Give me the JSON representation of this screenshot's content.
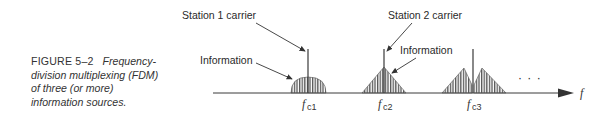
{
  "caption": {
    "figure_label": "FIGURE 5–2",
    "text_lines": [
      "Frequency-",
      "division multiplexing (FDM)",
      "of three (or more)",
      "information sources."
    ]
  },
  "diagram": {
    "annotations": {
      "station1_carrier": "Station 1 carrier",
      "station2_carrier": "Station 2 carrier",
      "information_left": "Information",
      "information_right": "Information"
    },
    "axis": {
      "label": "f",
      "ellipsis": "· · ·"
    },
    "carriers": [
      {
        "label_main": "f",
        "label_sub": "c1",
        "shape": "semicircle"
      },
      {
        "label_main": "f",
        "label_sub": "c2",
        "shape": "triangle"
      },
      {
        "label_main": "f",
        "label_sub": "c3",
        "shape": "double-triangle"
      }
    ],
    "colors": {
      "line": "#3a3a3a",
      "hatch": "#555555",
      "background": "#ffffff"
    }
  }
}
